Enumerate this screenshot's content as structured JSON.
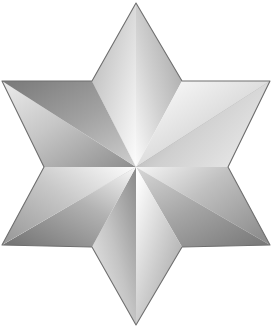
{
  "image": {
    "title": "Six-pointed metallic star",
    "subject": "hexagram-star",
    "alt_text": "A six-pointed star rendered in polished silver with faceted gradient shading",
    "width": 272,
    "height": 334,
    "background_color": "#ffffff"
  },
  "palette": {
    "background": "#ffffff",
    "highlight": "#fdfdfd",
    "light": "#ededed",
    "mid_light": "#d2d2d2",
    "mid": "#b0b0b0",
    "mid_dark": "#949494",
    "dark": "#7d7d7d",
    "darkest": "#6a6a6a",
    "outline": "#6f6f6f"
  },
  "geometry": {
    "center": {
      "x": 136,
      "y": 167
    },
    "outer_radius": 164,
    "inner_radius": 95,
    "points": 6,
    "rotation_degrees": 0,
    "outer_vertices": [
      {
        "name": "top",
        "x": 136,
        "y": 3
      },
      {
        "name": "upper-right",
        "x": 270,
        "y": 81
      },
      {
        "name": "lower-right",
        "x": 270,
        "y": 245
      },
      {
        "name": "bottom",
        "x": 136,
        "y": 325
      },
      {
        "name": "lower-left",
        "x": 2,
        "y": 245
      },
      {
        "name": "upper-left",
        "x": 2,
        "y": 81
      }
    ],
    "inner_vertices": [
      {
        "name": "upper-right-notch",
        "x": 182,
        "y": 81
      },
      {
        "name": "right-notch",
        "x": 228,
        "y": 167
      },
      {
        "name": "lower-right-notch",
        "x": 182,
        "y": 247
      },
      {
        "name": "lower-left-notch",
        "x": 92,
        "y": 247
      },
      {
        "name": "left-notch",
        "x": 44,
        "y": 167
      },
      {
        "name": "upper-left-notch",
        "x": 92,
        "y": 81
      }
    ]
  },
  "facets": [
    {
      "id": "facet-1",
      "name": "top-left-facet",
      "start": "#8c8c8c",
      "end": "#f2f2f2"
    },
    {
      "id": "facet-2",
      "name": "top-right-facet",
      "start": "#fbfbfb",
      "end": "#a3a3a3"
    },
    {
      "id": "facet-3",
      "name": "upper-right-upper-facet",
      "start": "#ffffff",
      "end": "#b4b4b4"
    },
    {
      "id": "facet-4",
      "name": "upper-right-lower-facet",
      "start": "#c9c9c9",
      "end": "#7f7f7f"
    },
    {
      "id": "facet-5",
      "name": "right-upper-facet",
      "start": "#9a9a9a",
      "end": "#e6e6e6"
    },
    {
      "id": "facet-6",
      "name": "right-lower-facet",
      "start": "#f6f6f6",
      "end": "#8f8f8f"
    },
    {
      "id": "facet-7",
      "name": "lower-right-upper-facet",
      "start": "#d8d8d8",
      "end": "#7a7a7a"
    },
    {
      "id": "facet-8",
      "name": "lower-right-lower-facet",
      "start": "#ffffff",
      "end": "#9d9d9d"
    },
    {
      "id": "facet-9",
      "name": "bottom-right-facet",
      "start": "#8a8a8a",
      "end": "#efefef"
    },
    {
      "id": "facet-10",
      "name": "bottom-left-facet",
      "start": "#fafafa",
      "end": "#757575"
    },
    {
      "id": "facet-11",
      "name": "lower-left-lower-facet",
      "start": "#a8a8a8",
      "end": "#f4f4f4"
    },
    {
      "id": "facet-12",
      "name": "lower-left-upper-facet",
      "start": "#e2e2e2",
      "end": "#888888"
    },
    {
      "id": "facet-13",
      "name": "left-lower-facet",
      "start": "#fdfdfd",
      "end": "#9c9c9c"
    },
    {
      "id": "facet-14",
      "name": "left-upper-facet",
      "start": "#8d8d8d",
      "end": "#ececec"
    },
    {
      "id": "facet-15",
      "name": "upper-left-lower-facet",
      "start": "#cfcfcf",
      "end": "#7c7c7c"
    },
    {
      "id": "facet-16",
      "name": "upper-left-upper-facet",
      "start": "#fcfcfc",
      "end": "#b8b8b8"
    }
  ]
}
